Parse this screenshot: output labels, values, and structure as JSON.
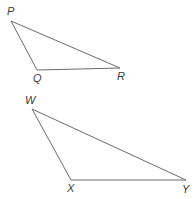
{
  "figure": {
    "background_color": "#ffffff",
    "stroke_color": "#6b6b6b",
    "stroke_width": 1,
    "label_color": "#3b3b3b",
    "canvas": {
      "width": 195,
      "height": 199
    }
  },
  "chart_data": {
    "type": "diagram",
    "xlabel": "",
    "ylabel": "",
    "shapes": [
      {
        "name": "triangle-pqr",
        "vertices": [
          {
            "label": "P",
            "x": 11,
            "y": 21
          },
          {
            "label": "Q",
            "x": 37,
            "y": 70
          },
          {
            "label": "R",
            "x": 120,
            "y": 68
          }
        ]
      },
      {
        "name": "triangle-wxy",
        "vertices": [
          {
            "label": "W",
            "x": 32,
            "y": 109
          },
          {
            "label": "X",
            "x": 71,
            "y": 180
          },
          {
            "label": "Y",
            "x": 186,
            "y": 180
          }
        ]
      }
    ]
  },
  "triangle_pqr": {
    "name": "Triangle PQR",
    "path": "M 11 21 L 37 70 L 120 68 Z",
    "labels": {
      "p": {
        "text": "P",
        "left": 7,
        "top": 6
      },
      "q": {
        "text": "Q",
        "left": 33,
        "top": 73
      },
      "r": {
        "text": "R",
        "left": 117,
        "top": 71
      }
    }
  },
  "triangle_wxy": {
    "name": "Triangle WXY",
    "path": "M 32 109 L 71 180 L 186 180 Z",
    "labels": {
      "w": {
        "text": "W",
        "left": 25,
        "top": 95
      },
      "x": {
        "text": "X",
        "left": 67,
        "top": 183
      },
      "y": {
        "text": "Y",
        "left": 182,
        "top": 184
      }
    }
  }
}
